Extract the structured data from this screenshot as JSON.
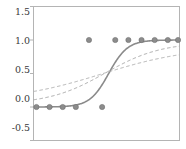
{
  "chart_data": {
    "type": "scatter",
    "title": "",
    "xlabel": "",
    "ylabel": "",
    "xlim": [
      0,
      10
    ],
    "ylim": [
      -0.5,
      1.5
    ],
    "grid": false,
    "legend": "none",
    "y_ticks": [
      -0.5,
      0.0,
      0.5,
      1.0,
      1.5
    ],
    "y_tick_labels": [
      "-0.5",
      "0.0",
      "0.5",
      "1.0",
      "1.5"
    ],
    "x_ticks": [],
    "x_tick_labels": [],
    "marker_color": "#8c8c8c",
    "marker_edge_color": "#6f6f6f",
    "frame_color": "#b4b4b4",
    "points": {
      "name": "observations",
      "x": [
        0.2,
        1.1,
        2.0,
        2.9,
        3.8,
        4.7,
        5.6,
        6.5,
        7.4,
        8.3,
        9.2,
        9.9
      ],
      "y": [
        0.0,
        0.0,
        0.0,
        0.0,
        1.0,
        0.0,
        1.0,
        1.0,
        1.0,
        1.0,
        1.0,
        1.0
      ]
    },
    "series": [
      {
        "name": "curve-solid",
        "style": "solid",
        "color": "#8a8a8a",
        "width": 1.6,
        "midpoint": 5.15,
        "slope": 1.55,
        "lower": 0.0,
        "upper": 1.0
      },
      {
        "name": "curve-dashed-1",
        "style": "dashed",
        "color": "#a8a8a8",
        "width": 1.0,
        "midpoint": 4.9,
        "slope": 0.52,
        "lower": 0.04,
        "upper": 0.97
      },
      {
        "name": "curve-dashed-2",
        "style": "dashed",
        "color": "#b0b0b0",
        "width": 1.0,
        "midpoint": 4.7,
        "slope": 0.33,
        "lower": 0.09,
        "upper": 0.9
      }
    ]
  },
  "axis": {
    "tick_0": "1.5",
    "tick_1": "1.0",
    "tick_2": "0.5",
    "tick_3": "0.0",
    "tick_4": "-0.5"
  }
}
